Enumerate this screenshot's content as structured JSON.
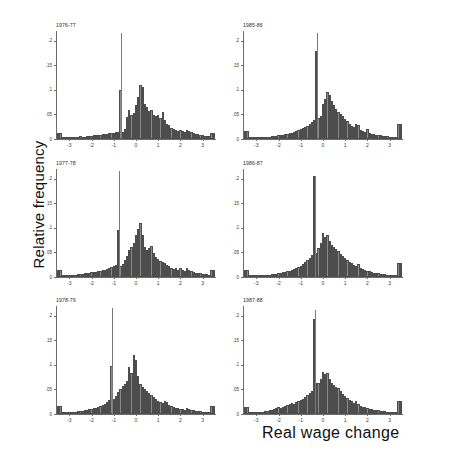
{
  "figure": {
    "ylabel": "Relative frequency",
    "xlabel": "Real wage change",
    "bar_color": "#8a8a8a",
    "bar_edge_color": "#4d4d4d",
    "axis_color": "#6d6d6d",
    "background": "#ffffff"
  },
  "chart_data": {
    "type": "bar",
    "title": "",
    "subtitle": "",
    "xlabel": "Real wage change",
    "ylabel": "Relative frequency",
    "xlim": [
      -3.6,
      3.6
    ],
    "ylim": [
      0,
      0.22
    ],
    "grid": false,
    "legend": null,
    "bin_width": 0.1,
    "layout": {
      "rows": 3,
      "cols": 2
    },
    "xticks": [
      -3,
      -2,
      -1,
      0,
      1,
      2,
      3
    ],
    "xticklabels": [
      "-3",
      "-2",
      "-1",
      "0",
      "1",
      "2",
      "3"
    ],
    "yticks": [
      0,
      0.05,
      0.1,
      0.15,
      0.2
    ],
    "yticklabels": [
      "0",
      ".05",
      ".1",
      ".15",
      ".2"
    ],
    "panels": [
      {
        "label": "1976-77",
        "row": 0,
        "col": 0,
        "spike": {
          "x": -0.65,
          "top": 0.215
        },
        "x": [
          -3.5,
          -3.4,
          -3.3,
          -3.2,
          -3.1,
          -3.0,
          -2.9,
          -2.8,
          -2.7,
          -2.6,
          -2.5,
          -2.4,
          -2.3,
          -2.2,
          -2.1,
          -2.0,
          -1.9,
          -1.8,
          -1.7,
          -1.6,
          -1.5,
          -1.4,
          -1.3,
          -1.2,
          -1.1,
          -1.0,
          -0.9,
          -0.8,
          -0.7,
          -0.6,
          -0.5,
          -0.4,
          -0.3,
          -0.2,
          -0.1,
          0.0,
          0.1,
          0.2,
          0.3,
          0.4,
          0.5,
          0.6,
          0.7,
          0.8,
          0.9,
          1.0,
          1.1,
          1.2,
          1.3,
          1.4,
          1.5,
          1.6,
          1.7,
          1.8,
          1.9,
          2.0,
          2.1,
          2.2,
          2.3,
          2.4,
          2.5,
          2.6,
          2.7,
          2.8,
          2.9,
          3.0,
          3.1,
          3.2,
          3.3,
          3.4,
          3.5
        ],
        "values": [
          0.012,
          0.012,
          0.003,
          0.002,
          0.002,
          0.004,
          0.004,
          0.003,
          0.003,
          0.004,
          0.006,
          0.005,
          0.005,
          0.006,
          0.006,
          0.007,
          0.008,
          0.008,
          0.009,
          0.009,
          0.01,
          0.011,
          0.011,
          0.012,
          0.012,
          0.013,
          0.014,
          0.015,
          0.1,
          0.014,
          0.02,
          0.045,
          0.06,
          0.048,
          0.052,
          0.07,
          0.086,
          0.11,
          0.105,
          0.072,
          0.066,
          0.058,
          0.06,
          0.048,
          0.046,
          0.048,
          0.042,
          0.055,
          0.038,
          0.03,
          0.028,
          0.022,
          0.02,
          0.018,
          0.016,
          0.018,
          0.016,
          0.014,
          0.018,
          0.016,
          0.014,
          0.012,
          0.01,
          0.01,
          0.009,
          0.008,
          0.007,
          0.006,
          0.006,
          0.013,
          0.013
        ]
      },
      {
        "label": "1985-86",
        "row": 0,
        "col": 1,
        "spike": {
          "x": -0.25,
          "top": 0.215
        },
        "x": [
          -3.5,
          -3.4,
          -3.3,
          -3.2,
          -3.1,
          -3.0,
          -2.9,
          -2.8,
          -2.7,
          -2.6,
          -2.5,
          -2.4,
          -2.3,
          -2.2,
          -2.1,
          -2.0,
          -1.9,
          -1.8,
          -1.7,
          -1.6,
          -1.5,
          -1.4,
          -1.3,
          -1.2,
          -1.1,
          -1.0,
          -0.9,
          -0.8,
          -0.7,
          -0.6,
          -0.5,
          -0.4,
          -0.3,
          -0.2,
          -0.1,
          0.0,
          0.1,
          0.2,
          0.3,
          0.4,
          0.5,
          0.6,
          0.7,
          0.8,
          0.9,
          1.0,
          1.1,
          1.2,
          1.3,
          1.4,
          1.5,
          1.6,
          1.7,
          1.8,
          1.9,
          2.0,
          2.1,
          2.2,
          2.3,
          2.4,
          2.5,
          2.6,
          2.7,
          2.8,
          2.9,
          3.0,
          3.1,
          3.2,
          3.3,
          3.4,
          3.5
        ],
        "values": [
          0.016,
          0.016,
          0.003,
          0.002,
          0.002,
          0.003,
          0.003,
          0.003,
          0.004,
          0.004,
          0.005,
          0.005,
          0.006,
          0.006,
          0.007,
          0.008,
          0.008,
          0.009,
          0.01,
          0.011,
          0.012,
          0.013,
          0.014,
          0.016,
          0.018,
          0.02,
          0.022,
          0.024,
          0.027,
          0.03,
          0.034,
          0.038,
          0.18,
          0.043,
          0.046,
          0.072,
          0.082,
          0.096,
          0.09,
          0.078,
          0.07,
          0.062,
          0.055,
          0.05,
          0.046,
          0.04,
          0.036,
          0.03,
          0.026,
          0.024,
          0.03,
          0.028,
          0.018,
          0.016,
          0.014,
          0.02,
          0.012,
          0.01,
          0.01,
          0.009,
          0.008,
          0.008,
          0.007,
          0.006,
          0.006,
          0.005,
          0.005,
          0.004,
          0.004,
          0.03,
          0.03
        ]
      },
      {
        "label": "1977-78",
        "row": 1,
        "col": 0,
        "spike": {
          "x": -0.75,
          "top": 0.215
        },
        "x": [
          -3.5,
          -3.4,
          -3.3,
          -3.2,
          -3.1,
          -3.0,
          -2.9,
          -2.8,
          -2.7,
          -2.6,
          -2.5,
          -2.4,
          -2.3,
          -2.2,
          -2.1,
          -2.0,
          -1.9,
          -1.8,
          -1.7,
          -1.6,
          -1.5,
          -1.4,
          -1.3,
          -1.2,
          -1.1,
          -1.0,
          -0.9,
          -0.8,
          -0.7,
          -0.6,
          -0.5,
          -0.4,
          -0.3,
          -0.2,
          -0.1,
          0.0,
          0.1,
          0.2,
          0.3,
          0.4,
          0.5,
          0.6,
          0.7,
          0.8,
          0.9,
          1.0,
          1.1,
          1.2,
          1.3,
          1.4,
          1.5,
          1.6,
          1.7,
          1.8,
          1.9,
          2.0,
          2.1,
          2.2,
          2.3,
          2.4,
          2.5,
          2.6,
          2.7,
          2.8,
          2.9,
          3.0,
          3.1,
          3.2,
          3.3,
          3.4,
          3.5
        ],
        "values": [
          0.014,
          0.014,
          0.004,
          0.003,
          0.003,
          0.005,
          0.004,
          0.004,
          0.005,
          0.006,
          0.006,
          0.007,
          0.008,
          0.008,
          0.009,
          0.01,
          0.01,
          0.011,
          0.012,
          0.013,
          0.014,
          0.015,
          0.016,
          0.018,
          0.02,
          0.022,
          0.024,
          0.095,
          0.022,
          0.026,
          0.034,
          0.042,
          0.055,
          0.062,
          0.07,
          0.085,
          0.098,
          0.11,
          0.086,
          0.062,
          0.056,
          0.06,
          0.064,
          0.048,
          0.04,
          0.036,
          0.032,
          0.03,
          0.028,
          0.024,
          0.022,
          0.018,
          0.016,
          0.018,
          0.014,
          0.018,
          0.014,
          0.012,
          0.018,
          0.014,
          0.012,
          0.01,
          0.009,
          0.008,
          0.008,
          0.007,
          0.006,
          0.006,
          0.005,
          0.015,
          0.015
        ]
      },
      {
        "label": "1986-87",
        "row": 1,
        "col": 1,
        "spike": {
          "x": -0.35,
          "top": 0.205
        },
        "x": [
          -3.5,
          -3.4,
          -3.3,
          -3.2,
          -3.1,
          -3.0,
          -2.9,
          -2.8,
          -2.7,
          -2.6,
          -2.5,
          -2.4,
          -2.3,
          -2.2,
          -2.1,
          -2.0,
          -1.9,
          -1.8,
          -1.7,
          -1.6,
          -1.5,
          -1.4,
          -1.3,
          -1.2,
          -1.1,
          -1.0,
          -0.9,
          -0.8,
          -0.7,
          -0.6,
          -0.5,
          -0.4,
          -0.3,
          -0.2,
          -0.1,
          0.0,
          0.1,
          0.2,
          0.3,
          0.4,
          0.5,
          0.6,
          0.7,
          0.8,
          0.9,
          1.0,
          1.1,
          1.2,
          1.3,
          1.4,
          1.5,
          1.6,
          1.7,
          1.8,
          1.9,
          2.0,
          2.1,
          2.2,
          2.3,
          2.4,
          2.5,
          2.6,
          2.7,
          2.8,
          2.9,
          3.0,
          3.1,
          3.2,
          3.3,
          3.4,
          3.5
        ],
        "values": [
          0.014,
          0.014,
          0.003,
          0.002,
          0.002,
          0.004,
          0.003,
          0.003,
          0.004,
          0.004,
          0.005,
          0.005,
          0.006,
          0.007,
          0.007,
          0.008,
          0.009,
          0.01,
          0.011,
          0.012,
          0.013,
          0.014,
          0.016,
          0.018,
          0.02,
          0.022,
          0.026,
          0.03,
          0.034,
          0.038,
          0.044,
          0.205,
          0.048,
          0.06,
          0.07,
          0.09,
          0.082,
          0.086,
          0.074,
          0.066,
          0.062,
          0.058,
          0.054,
          0.046,
          0.042,
          0.038,
          0.034,
          0.03,
          0.028,
          0.024,
          0.022,
          0.026,
          0.018,
          0.016,
          0.014,
          0.012,
          0.012,
          0.01,
          0.009,
          0.008,
          0.008,
          0.007,
          0.006,
          0.006,
          0.005,
          0.005,
          0.004,
          0.004,
          0.004,
          0.028,
          0.028
        ]
      },
      {
        "label": "1978-79",
        "row": 2,
        "col": 0,
        "spike": {
          "x": -1.05,
          "top": 0.215
        },
        "x": [
          -3.5,
          -3.4,
          -3.3,
          -3.2,
          -3.1,
          -3.0,
          -2.9,
          -2.8,
          -2.7,
          -2.6,
          -2.5,
          -2.4,
          -2.3,
          -2.2,
          -2.1,
          -2.0,
          -1.9,
          -1.8,
          -1.7,
          -1.6,
          -1.5,
          -1.4,
          -1.3,
          -1.2,
          -1.1,
          -1.0,
          -0.9,
          -0.8,
          -0.7,
          -0.6,
          -0.5,
          -0.4,
          -0.3,
          -0.2,
          -0.1,
          0.0,
          0.1,
          0.2,
          0.3,
          0.4,
          0.5,
          0.6,
          0.7,
          0.8,
          0.9,
          1.0,
          1.1,
          1.2,
          1.3,
          1.4,
          1.5,
          1.6,
          1.7,
          1.8,
          1.9,
          2.0,
          2.1,
          2.2,
          2.3,
          2.4,
          2.5,
          2.6,
          2.7,
          2.8,
          2.9,
          3.0,
          3.1,
          3.2,
          3.3,
          3.4,
          3.5
        ],
        "values": [
          0.016,
          0.016,
          0.004,
          0.003,
          0.003,
          0.005,
          0.004,
          0.004,
          0.005,
          0.006,
          0.006,
          0.007,
          0.008,
          0.009,
          0.01,
          0.011,
          0.012,
          0.013,
          0.014,
          0.016,
          0.018,
          0.02,
          0.024,
          0.028,
          0.097,
          0.03,
          0.036,
          0.044,
          0.05,
          0.058,
          0.062,
          0.068,
          0.095,
          0.084,
          0.12,
          0.11,
          0.078,
          0.062,
          0.056,
          0.05,
          0.046,
          0.042,
          0.038,
          0.034,
          0.03,
          0.026,
          0.024,
          0.022,
          0.026,
          0.024,
          0.018,
          0.016,
          0.014,
          0.012,
          0.012,
          0.01,
          0.01,
          0.009,
          0.012,
          0.01,
          0.008,
          0.008,
          0.007,
          0.006,
          0.006,
          0.005,
          0.005,
          0.004,
          0.004,
          0.016,
          0.016
        ]
      },
      {
        "label": "1987-88",
        "row": 2,
        "col": 1,
        "spike": {
          "x": -0.35,
          "top": 0.212
        },
        "x": [
          -3.5,
          -3.4,
          -3.3,
          -3.2,
          -3.1,
          -3.0,
          -2.9,
          -2.8,
          -2.7,
          -2.6,
          -2.5,
          -2.4,
          -2.3,
          -2.2,
          -2.1,
          -2.0,
          -1.9,
          -1.8,
          -1.7,
          -1.6,
          -1.5,
          -1.4,
          -1.3,
          -1.2,
          -1.1,
          -1.0,
          -0.9,
          -0.8,
          -0.7,
          -0.6,
          -0.5,
          -0.4,
          -0.3,
          -0.2,
          -0.1,
          0.0,
          0.1,
          0.2,
          0.3,
          0.4,
          0.5,
          0.6,
          0.7,
          0.8,
          0.9,
          1.0,
          1.1,
          1.2,
          1.3,
          1.4,
          1.5,
          1.6,
          1.7,
          1.8,
          1.9,
          2.0,
          2.1,
          2.2,
          2.3,
          2.4,
          2.5,
          2.6,
          2.7,
          2.8,
          2.9,
          3.0,
          3.1,
          3.2,
          3.3,
          3.4,
          3.5
        ],
        "values": [
          0.014,
          0.014,
          0.004,
          0.003,
          0.003,
          0.005,
          0.004,
          0.004,
          0.005,
          0.006,
          0.007,
          0.008,
          0.009,
          0.01,
          0.012,
          0.014,
          0.013,
          0.015,
          0.016,
          0.018,
          0.02,
          0.022,
          0.02,
          0.024,
          0.026,
          0.028,
          0.03,
          0.034,
          0.038,
          0.042,
          0.046,
          0.194,
          0.064,
          0.064,
          0.072,
          0.086,
          0.082,
          0.084,
          0.072,
          0.064,
          0.06,
          0.056,
          0.052,
          0.046,
          0.04,
          0.036,
          0.032,
          0.028,
          0.026,
          0.022,
          0.026,
          0.02,
          0.016,
          0.014,
          0.014,
          0.012,
          0.01,
          0.01,
          0.009,
          0.008,
          0.008,
          0.007,
          0.006,
          0.006,
          0.005,
          0.005,
          0.004,
          0.004,
          0.004,
          0.026,
          0.026
        ]
      }
    ]
  }
}
